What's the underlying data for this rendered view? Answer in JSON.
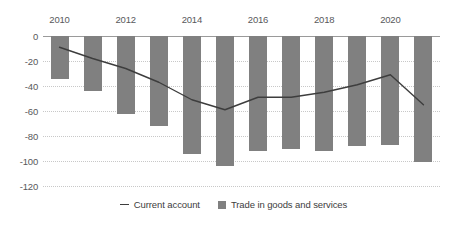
{
  "chart_data": {
    "type": "bar",
    "title": "",
    "subtitle": "",
    "xlabel": "",
    "ylabel": "",
    "ylim": [
      -120,
      0
    ],
    "yticks": [
      0,
      -20,
      -40,
      -60,
      -80,
      -100,
      -120
    ],
    "ytick_labels": [
      "0",
      "-20",
      "-40",
      "-60",
      "-80",
      "-100",
      "-120"
    ],
    "grid": true,
    "legend_position": "bottom-center",
    "categories": [
      "2010",
      "2011",
      "2012",
      "2013",
      "2014",
      "2015",
      "2016",
      "2017",
      "2018",
      "2019",
      "2020",
      "2021"
    ],
    "xtick_labels": [
      "2010",
      "",
      "2012",
      "",
      "2014",
      "",
      "2016",
      "",
      "2018",
      "",
      "2020",
      ""
    ],
    "series": [
      {
        "name": "Trade in goods and services",
        "type": "bar",
        "color": "#808080",
        "values": [
          -34,
          -44,
          -62,
          -72,
          -94,
          -104,
          -92,
          -90,
          -92,
          -88,
          -87,
          -101
        ]
      },
      {
        "name": "Current account",
        "type": "line",
        "color": "#3d3d3d",
        "values": [
          -9,
          -18,
          -26,
          -37,
          -51,
          -59,
          -49,
          -49,
          -45,
          -39,
          -31,
          -55
        ]
      }
    ]
  },
  "legend": {
    "items": [
      {
        "label": "Current account",
        "marker": "line-marker"
      },
      {
        "label": "Trade in goods and services",
        "marker": "square-marker"
      }
    ]
  },
  "colors": {
    "bar": "#808080",
    "line": "#3d3d3d",
    "grid": "#c8c8c8",
    "zero_axis": "#9a9a9a",
    "text": "#58595b",
    "background": "#ffffff"
  }
}
